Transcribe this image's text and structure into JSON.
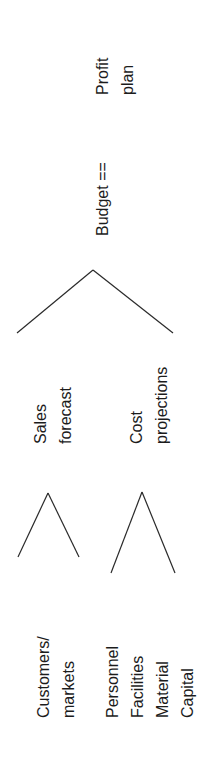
{
  "diagram": {
    "type": "tree",
    "orientation": "rotated -90 degrees (reads bottom to top)",
    "root": {
      "label_line1": "Budget ==",
      "equals_label_line1": "Profit",
      "equals_label_line2": "plan"
    },
    "level1": [
      {
        "line1": "Sales",
        "line2": "forecast"
      },
      {
        "line1": "Cost",
        "line2": "projections"
      }
    ],
    "level2": {
      "sales_inputs": {
        "line1": "Customers/",
        "line2": "markets"
      },
      "cost_inputs": [
        "Personnel",
        "Facilities",
        "Material",
        "Capital"
      ]
    },
    "line_color": "#2a2a2a",
    "text_color": "#1c1c1c"
  }
}
